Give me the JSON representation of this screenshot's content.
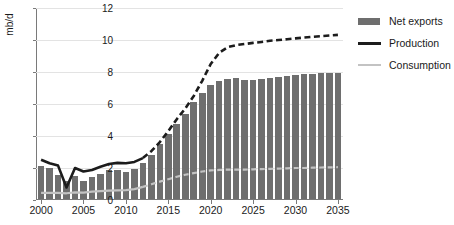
{
  "chart_data": {
    "type": "bar",
    "title": "",
    "subtitle": "",
    "xlabel": "",
    "ylabel": "mb/d",
    "xlim": [
      1999.4,
      2035.6
    ],
    "ylim": [
      0,
      12
    ],
    "grid": true,
    "legend_position": "right",
    "y_ticks": [
      0,
      2,
      4,
      6,
      8,
      10,
      12
    ],
    "x_ticks": [
      2000,
      2005,
      2010,
      2015,
      2020,
      2025,
      2030,
      2035
    ],
    "x_tick_labels": [
      "2000",
      "2005",
      "2010",
      "2015",
      "2020",
      "2025",
      "2030",
      "2035"
    ],
    "y_tick_labels": [
      "0",
      "2",
      "4",
      "6",
      "8",
      "10",
      "12"
    ],
    "categories": [
      2000,
      2001,
      2002,
      2003,
      2004,
      2005,
      2006,
      2007,
      2008,
      2009,
      2010,
      2011,
      2012,
      2013,
      2014,
      2015,
      2016,
      2017,
      2018,
      2019,
      2020,
      2021,
      2022,
      2023,
      2024,
      2025,
      2026,
      2027,
      2028,
      2029,
      2030,
      2031,
      2032,
      2033,
      2034,
      2035
    ],
    "history_end_year": 2012,
    "series": [
      {
        "name": "Net exports",
        "type": "bar",
        "color": "#6e6e6e",
        "values": [
          2.05,
          1.92,
          1.5,
          1.12,
          1.45,
          1.15,
          1.4,
          1.55,
          1.8,
          1.82,
          1.68,
          1.88,
          2.28,
          2.78,
          3.45,
          4.05,
          4.68,
          5.3,
          6.05,
          6.6,
          7.12,
          7.38,
          7.5,
          7.55,
          7.45,
          7.45,
          7.48,
          7.55,
          7.62,
          7.68,
          7.78,
          7.8,
          7.82,
          7.85,
          7.88,
          7.9
        ]
      },
      {
        "name": "Production",
        "type": "line",
        "color": "#1c1c1c",
        "values": [
          2.52,
          2.3,
          2.15,
          0.78,
          2.0,
          1.78,
          1.88,
          2.08,
          2.25,
          2.32,
          2.3,
          2.38,
          2.62,
          3.05,
          3.62,
          4.3,
          5.05,
          5.72,
          6.5,
          7.45,
          8.5,
          9.2,
          9.55,
          9.68,
          9.75,
          9.82,
          9.88,
          9.95,
          10.0,
          10.05,
          10.1,
          10.15,
          10.2,
          10.24,
          10.28,
          10.32
        ]
      },
      {
        "name": "Consumption",
        "type": "line",
        "color": "#c3c3c3",
        "values": [
          0.45,
          0.45,
          0.45,
          0.42,
          0.48,
          0.46,
          0.52,
          0.55,
          0.58,
          0.6,
          0.62,
          0.68,
          0.82,
          0.98,
          1.15,
          1.3,
          1.45,
          1.58,
          1.68,
          1.78,
          1.85,
          1.88,
          1.9,
          1.9,
          1.9,
          1.92,
          1.93,
          1.95,
          1.96,
          1.98,
          2.0,
          2.0,
          2.02,
          2.03,
          2.04,
          2.05
        ]
      }
    ]
  },
  "legend": {
    "items": [
      {
        "label": "Net exports",
        "marker": "bar-swatch"
      },
      {
        "label": "Production",
        "marker": "line-swatch-dark"
      },
      {
        "label": "Consumption",
        "marker": "line-swatch-light"
      }
    ]
  }
}
